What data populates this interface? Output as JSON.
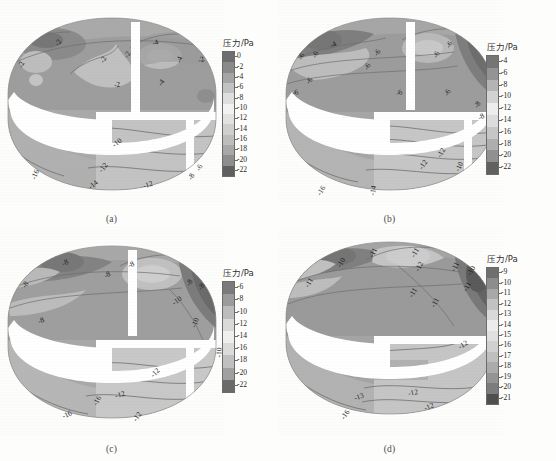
{
  "figure": {
    "colorbar_title": "压力/Pa",
    "panels": [
      {
        "id": "a",
        "caption": "(a)",
        "colorbar": {
          "title": "压力/Pa",
          "ticks": [
            "0",
            "-2",
            "-4",
            "-6",
            "-8",
            "-10",
            "-12",
            "-14",
            "-16",
            "-18",
            "-20",
            "-22"
          ],
          "colors": [
            "#6e6e6e",
            "#8a8a8a",
            "#a5a5a5",
            "#c2c2c2",
            "#dedede",
            "#f2f2f2",
            "#e2e2e2",
            "#cfcfcf",
            "#bdbdbd",
            "#a8a8a8",
            "#8e8e8e",
            "#5f5f5f"
          ]
        },
        "contour_labels": [
          {
            "text": "-2",
            "x": 18,
            "y": 60,
            "rot": -70
          },
          {
            "text": "-2",
            "x": 55,
            "y": 38,
            "rot": -55
          },
          {
            "text": "-2",
            "x": 100,
            "y": 55,
            "rot": -62
          },
          {
            "text": "-2",
            "x": 124,
            "y": 50,
            "rot": -60
          },
          {
            "text": "-2",
            "x": 114,
            "y": 80,
            "rot": -8
          },
          {
            "text": "-4",
            "x": 152,
            "y": 38,
            "rot": -18
          },
          {
            "text": "-4",
            "x": 176,
            "y": 55,
            "rot": -70
          },
          {
            "text": "-4",
            "x": 158,
            "y": 78,
            "rot": -55
          },
          {
            "text": "-2",
            "x": 198,
            "y": 55,
            "rot": -20
          },
          {
            "text": "-10",
            "x": 112,
            "y": 138,
            "rot": -38
          },
          {
            "text": "-12",
            "x": 98,
            "y": 163,
            "rot": -52
          },
          {
            "text": "-14",
            "x": 88,
            "y": 180,
            "rot": -40
          },
          {
            "text": "-16",
            "x": 30,
            "y": 170,
            "rot": -68
          },
          {
            "text": "-12",
            "x": 143,
            "y": 180,
            "rot": -18
          },
          {
            "text": "-8",
            "x": 188,
            "y": 172,
            "rot": -62
          },
          {
            "text": "-6",
            "x": 196,
            "y": 163,
            "rot": -62
          }
        ]
      },
      {
        "id": "b",
        "caption": "(b)",
        "colorbar": {
          "title": "压力/Pa",
          "ticks": [
            "-4",
            "-6",
            "-8",
            "-10",
            "-12",
            "-14",
            "-16",
            "-18",
            "-20",
            "-22"
          ],
          "colors": [
            "#757575",
            "#949494",
            "#b4b4b4",
            "#d2d2d2",
            "#ededed",
            "#dcdcdc",
            "#c6c6c6",
            "#aeaeae",
            "#909090",
            "#616161"
          ]
        },
        "contour_labels": [
          {
            "text": "-4",
            "x": 52,
            "y": 40,
            "rot": -25
          },
          {
            "text": "-6",
            "x": 20,
            "y": 52,
            "rot": -60
          },
          {
            "text": "-6",
            "x": 34,
            "y": 50,
            "rot": -60
          },
          {
            "text": "-6",
            "x": 14,
            "y": 88,
            "rot": -18
          },
          {
            "text": "-6",
            "x": 28,
            "y": 76,
            "rot": -55
          },
          {
            "text": "-6",
            "x": 96,
            "y": 48,
            "rot": -55
          },
          {
            "text": "-6",
            "x": 86,
            "y": 62,
            "rot": -60
          },
          {
            "text": "-6",
            "x": 118,
            "y": 88,
            "rot": -20
          },
          {
            "text": "-6",
            "x": 168,
            "y": 40,
            "rot": -60
          },
          {
            "text": "-6",
            "x": 155,
            "y": 50,
            "rot": -60
          },
          {
            "text": "-6",
            "x": 166,
            "y": 88,
            "rot": -60
          },
          {
            "text": "-8",
            "x": 196,
            "y": 100,
            "rot": -60
          },
          {
            "text": "-8",
            "x": 200,
            "y": 112,
            "rot": -30
          },
          {
            "text": "-12",
            "x": 158,
            "y": 148,
            "rot": -60
          },
          {
            "text": "-12",
            "x": 140,
            "y": 160,
            "rot": -55
          },
          {
            "text": "-10",
            "x": 176,
            "y": 162,
            "rot": -65
          },
          {
            "text": "-14",
            "x": 90,
            "y": 186,
            "rot": -80
          },
          {
            "text": "-16",
            "x": 38,
            "y": 186,
            "rot": -58
          }
        ]
      },
      {
        "id": "c",
        "caption": "(c)",
        "colorbar": {
          "title": "压力/Pa",
          "ticks": [
            "-6",
            "-8",
            "-10",
            "-12",
            "-14",
            "-16",
            "-18",
            "-20",
            "-22"
          ],
          "colors": [
            "#7a7a7a",
            "#9b9b9b",
            "#bcbcbc",
            "#dadada",
            "#efefef",
            "#dbdbdb",
            "#c0c0c0",
            "#a0a0a0",
            "#6a6a6a"
          ]
        },
        "contour_labels": [
          {
            "text": "-8",
            "x": 62,
            "y": 28,
            "rot": -28
          },
          {
            "text": "-8",
            "x": 128,
            "y": 30,
            "rot": -25
          },
          {
            "text": "-8",
            "x": 104,
            "y": 40,
            "rot": -30
          },
          {
            "text": "-8",
            "x": 22,
            "y": 50,
            "rot": -55
          },
          {
            "text": "-8",
            "x": 38,
            "y": 86,
            "rot": -25
          },
          {
            "text": "-8",
            "x": 186,
            "y": 48,
            "rot": -60
          },
          {
            "text": "-8",
            "x": 198,
            "y": 52,
            "rot": -60
          },
          {
            "text": "-10",
            "x": 172,
            "y": 66,
            "rot": -35
          },
          {
            "text": "-10",
            "x": 190,
            "y": 88,
            "rot": -70
          },
          {
            "text": "-10",
            "x": 214,
            "y": 118,
            "rot": -88
          },
          {
            "text": "-12",
            "x": 150,
            "y": 138,
            "rot": -45
          },
          {
            "text": "-12",
            "x": 115,
            "y": 160,
            "rot": -15
          },
          {
            "text": "-12",
            "x": 132,
            "y": 182,
            "rot": -55
          },
          {
            "text": "-16",
            "x": 92,
            "y": 166,
            "rot": -60
          },
          {
            "text": "-16",
            "x": 62,
            "y": 180,
            "rot": -25
          }
        ]
      },
      {
        "id": "d",
        "caption": "(d)",
        "colorbar": {
          "title": "压力/Pa",
          "ticks": [
            "-9",
            "-10",
            "-11",
            "-12",
            "-13",
            "-14",
            "-15",
            "-16",
            "-17",
            "-18",
            "-19",
            "-20",
            "-21"
          ],
          "colors": [
            "#6f6f6f",
            "#8d8d8d",
            "#a8a8a8",
            "#c2c2c2",
            "#d9d9d9",
            "#ececec",
            "#e0e0e0",
            "#d0d0d0",
            "#bfbfbf",
            "#ababab",
            "#949494",
            "#7c7c7c",
            "#4f4f4f"
          ]
        },
        "contour_labels": [
          {
            "text": "-11",
            "x": 90,
            "y": 18,
            "rot": -62
          },
          {
            "text": "-11",
            "x": 132,
            "y": 18,
            "rot": -60
          },
          {
            "text": "-10",
            "x": 58,
            "y": 28,
            "rot": -60
          },
          {
            "text": "-11",
            "x": 26,
            "y": 48,
            "rot": -60
          },
          {
            "text": "-12",
            "x": 136,
            "y": 32,
            "rot": -62
          },
          {
            "text": "-11",
            "x": 172,
            "y": 32,
            "rot": -62
          },
          {
            "text": "-10",
            "x": 188,
            "y": 36,
            "rot": -60
          },
          {
            "text": "-11",
            "x": 184,
            "y": 52,
            "rot": -62
          },
          {
            "text": "-11",
            "x": 130,
            "y": 58,
            "rot": -60
          },
          {
            "text": "-11",
            "x": 152,
            "y": 68,
            "rot": -60
          },
          {
            "text": "-12",
            "x": 180,
            "y": 110,
            "rot": -30
          },
          {
            "text": "-12",
            "x": 130,
            "y": 158,
            "rot": -12
          },
          {
            "text": "-12",
            "x": 146,
            "y": 172,
            "rot": -22
          },
          {
            "text": "-13",
            "x": 76,
            "y": 162,
            "rot": -18
          },
          {
            "text": "-16",
            "x": 62,
            "y": 180,
            "rot": -55
          }
        ]
      }
    ]
  }
}
